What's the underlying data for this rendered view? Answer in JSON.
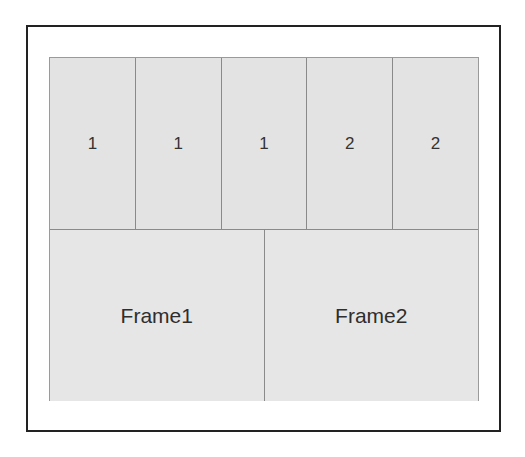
{
  "diagram": {
    "top_row": {
      "cells": [
        {
          "label": "1"
        },
        {
          "label": "1"
        },
        {
          "label": "1"
        },
        {
          "label": "2"
        },
        {
          "label": "2"
        }
      ]
    },
    "bottom_row": {
      "frames": [
        {
          "label": "Frame1"
        },
        {
          "label": "Frame2"
        }
      ]
    },
    "colors": {
      "cell_fill": "#e3e3e3",
      "divider": "#8a8a8a",
      "outer_border": "#222222",
      "text": "#333333"
    }
  }
}
